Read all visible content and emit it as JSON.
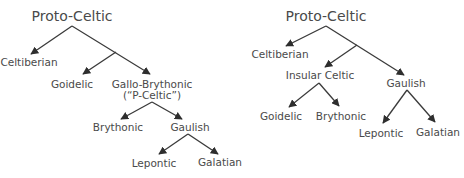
{
  "colors": {
    "text": "#4a4a4a",
    "line": "#3a3a3a",
    "background": "#ffffff"
  },
  "trees": [
    {
      "id": "left",
      "root": "Proto-Celtic",
      "nodes": {
        "root": "Proto-Celtic",
        "celtiberian": "Celtiberian",
        "goidelic": "Goidelic",
        "gallo_brythonic": "Gallo-Brythonic",
        "gallo_brythonic_note": "(“P-Celtic”)",
        "brythonic": "Brythonic",
        "gaulish": "Gaulish",
        "lepontic": "Lepontic",
        "galatian": "Galatian"
      },
      "edges": [
        [
          "Proto-Celtic",
          "Celtiberian"
        ],
        [
          "Proto-Celtic",
          "Goidelic"
        ],
        [
          "Proto-Celtic",
          "Gallo-Brythonic"
        ],
        [
          "Gallo-Brythonic",
          "Brythonic"
        ],
        [
          "Gallo-Brythonic",
          "Gaulish"
        ],
        [
          "Gaulish",
          "Lepontic"
        ],
        [
          "Gaulish",
          "Galatian"
        ]
      ]
    },
    {
      "id": "right",
      "root": "Proto-Celtic",
      "nodes": {
        "root": "Proto-Celtic",
        "celtiberian": "Celtiberian",
        "insular_celtic": "Insular Celtic",
        "gaulish": "Gaulish",
        "goidelic": "Goidelic",
        "brythonic": "Brythonic",
        "lepontic": "Lepontic",
        "galatian": "Galatian"
      },
      "edges": [
        [
          "Proto-Celtic",
          "Celtiberian"
        ],
        [
          "Proto-Celtic",
          "Insular Celtic"
        ],
        [
          "Proto-Celtic",
          "Gaulish"
        ],
        [
          "Insular Celtic",
          "Goidelic"
        ],
        [
          "Insular Celtic",
          "Brythonic"
        ],
        [
          "Gaulish",
          "Lepontic"
        ],
        [
          "Gaulish",
          "Galatian"
        ]
      ]
    }
  ]
}
